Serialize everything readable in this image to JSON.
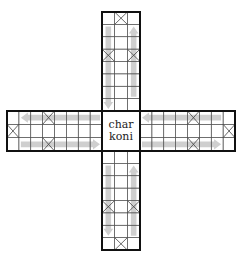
{
  "board": {
    "title": "Pachisi cross board",
    "center": {
      "line1": "char",
      "line2": "koni"
    },
    "colors": {
      "background": "#ffffff",
      "outer_border": "#111111",
      "grid_line": "#555555",
      "arrow": "#cfcfcf",
      "cross_mark": "#444444"
    },
    "arms": [
      {
        "name": "top",
        "x": 102,
        "y": 12,
        "w": 38,
        "h": 99,
        "cols": 3,
        "rows": 8,
        "safe_squares": [
          [
            0,
            1
          ],
          [
            3,
            0
          ],
          [
            3,
            2
          ]
        ],
        "arrows": [
          {
            "col": 0,
            "from_row": 1,
            "to_row": 7,
            "dir": "down"
          },
          {
            "col": 2,
            "from_row": 6,
            "to_row": 1,
            "dir": "up"
          }
        ]
      },
      {
        "name": "bottom",
        "x": 102,
        "y": 151,
        "w": 38,
        "h": 99,
        "cols": 3,
        "rows": 8,
        "safe_squares": [
          [
            4,
            0
          ],
          [
            4,
            2
          ],
          [
            7,
            1
          ]
        ],
        "arrows": [
          {
            "col": 0,
            "from_row": 1,
            "to_row": 6,
            "dir": "down"
          },
          {
            "col": 2,
            "from_row": 6,
            "to_row": 1,
            "dir": "up"
          }
        ]
      },
      {
        "name": "left",
        "x": 7,
        "y": 111,
        "w": 95,
        "h": 40,
        "cols": 8,
        "rows": 3,
        "safe_squares": [
          [
            1,
            0
          ],
          [
            0,
            3
          ],
          [
            2,
            3
          ]
        ],
        "arrows": [
          {
            "row": 0,
            "from_col": 7,
            "to_col": 1,
            "dir": "left"
          },
          {
            "row": 2,
            "from_col": 1,
            "to_col": 7,
            "dir": "right"
          }
        ]
      },
      {
        "name": "right",
        "x": 140,
        "y": 111,
        "w": 95,
        "h": 40,
        "cols": 8,
        "rows": 3,
        "safe_squares": [
          [
            0,
            4
          ],
          [
            2,
            4
          ],
          [
            1,
            7
          ]
        ],
        "arrows": [
          {
            "row": 0,
            "from_col": 6,
            "to_col": 0,
            "dir": "left"
          },
          {
            "row": 2,
            "from_col": 0,
            "to_col": 6,
            "dir": "right"
          }
        ]
      }
    ],
    "center_box": {
      "x": 102,
      "y": 111,
      "w": 38,
      "h": 40
    }
  }
}
